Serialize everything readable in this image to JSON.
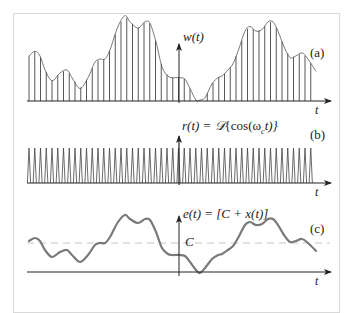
{
  "figure": {
    "panels": [
      {
        "id": "a",
        "tag": "(a)",
        "signal_label": "w(t)",
        "axis_label": "t",
        "description": "sampled signal: carrier pulses scaled by envelope e(t)"
      },
      {
        "id": "b",
        "tag": "(b)",
        "signal_label": "r(t) = 𝒟{cos(ωc t)}",
        "signal_label_parts": {
          "lhs": "r(t) = ",
          "op": "𝒟",
          "arg_open": "{cos(ω",
          "sub": "c",
          "arg_close": "t)}"
        },
        "axis_label": "t",
        "description": "periodic narrow pulse train"
      },
      {
        "id": "c",
        "tag": "(c)",
        "signal_label": "e(t) = [C + x(t)]",
        "axis_label": "t",
        "level_label": "C",
        "description": "envelope signal offset by constant C"
      }
    ],
    "envelope_points": [
      [
        29,
        241
      ],
      [
        35,
        238
      ],
      [
        40,
        241
      ],
      [
        45,
        250
      ],
      [
        52,
        257
      ],
      [
        60,
        252
      ],
      [
        67,
        250
      ],
      [
        72,
        255
      ],
      [
        80,
        262
      ],
      [
        88,
        255
      ],
      [
        95,
        245
      ],
      [
        100,
        243
      ],
      [
        105,
        243
      ],
      [
        110,
        237
      ],
      [
        118,
        222
      ],
      [
        125,
        215
      ],
      [
        130,
        219
      ],
      [
        138,
        223
      ],
      [
        145,
        219
      ],
      [
        150,
        220
      ],
      [
        156,
        232
      ],
      [
        162,
        248
      ],
      [
        168,
        254
      ],
      [
        172,
        255
      ],
      [
        179,
        255
      ],
      [
        185,
        256
      ],
      [
        190,
        262
      ],
      [
        196,
        270
      ],
      [
        200,
        273
      ],
      [
        205,
        268
      ],
      [
        212,
        259
      ],
      [
        218,
        255
      ],
      [
        222,
        254
      ],
      [
        228,
        250
      ],
      [
        233,
        246
      ],
      [
        238,
        238
      ],
      [
        245,
        225
      ],
      [
        250,
        222
      ],
      [
        256,
        225
      ],
      [
        262,
        224
      ],
      [
        268,
        219
      ],
      [
        273,
        219
      ],
      [
        278,
        225
      ],
      [
        284,
        235
      ],
      [
        290,
        242
      ],
      [
        296,
        241
      ],
      [
        302,
        239
      ],
      [
        308,
        243
      ],
      [
        316,
        251
      ]
    ],
    "pulse_train": {
      "x_start": 29,
      "x_end": 316,
      "spacing": 5.75
    },
    "colors": {
      "line": "#333333",
      "curve": "#7a7a7a",
      "dashed": "#c4c4c4",
      "frame": "#d9d9d9"
    }
  }
}
